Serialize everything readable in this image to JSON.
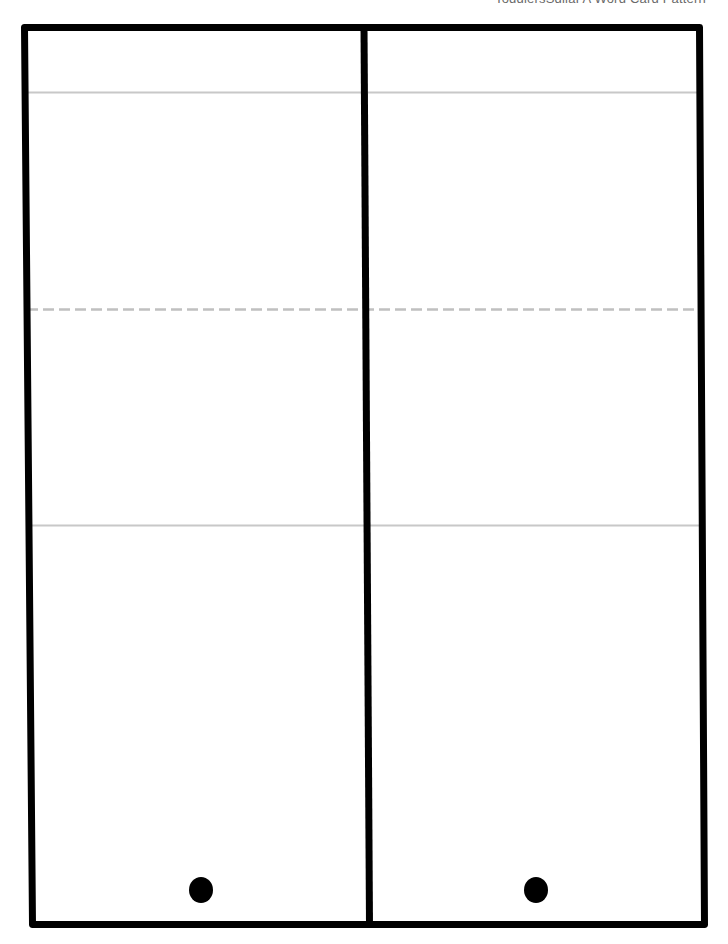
{
  "header": {
    "text": "ToddlersSdilaI A Word Card Pattern"
  },
  "page": {
    "type": "printable word card template",
    "panels": [
      {
        "name": "left-card",
        "sections": [
          "top-strip",
          "upper-area",
          "lower-area",
          "bottom-area"
        ],
        "hole_punch": true
      },
      {
        "name": "right-card",
        "sections": [
          "top-strip",
          "upper-area",
          "lower-area",
          "bottom-area"
        ],
        "hole_punch": true
      }
    ],
    "guide_lines": [
      {
        "style": "solid",
        "color": "#c8c8c8",
        "y": 92
      },
      {
        "style": "dashed",
        "color": "#c0c0c0",
        "y": 309
      },
      {
        "style": "solid",
        "color": "#c8c8c8",
        "y": 525
      }
    ],
    "border_color": "#000000",
    "hole_color": "#000000"
  }
}
